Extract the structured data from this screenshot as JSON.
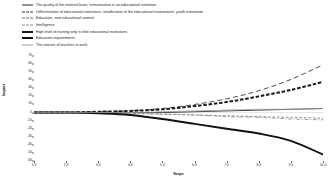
{
  "chart_data": {
    "type": "line",
    "title": "",
    "xlabel": "Steps",
    "ylabel": "Impact",
    "xlim": [
      1.0,
      10.0
    ],
    "ylim": [
      -60,
      70
    ],
    "grid": false,
    "legend_position": "above-plot",
    "xticks": [
      "1.0",
      "2.0",
      "3.0",
      "4.0",
      "5.0",
      "6.0",
      "7.0",
      "8.0",
      "9.0",
      "10.0"
    ],
    "yticks": [
      "70",
      "60",
      "50",
      "40",
      "30",
      "20",
      "10",
      "0",
      "-10",
      "-20",
      "-30",
      "-40",
      "-50",
      "-60"
    ],
    "x": [
      1.0,
      2.0,
      3.0,
      4.0,
      5.0,
      6.0,
      7.0,
      8.0,
      9.0,
      10.0
    ],
    "series": [
      {
        "name": "The quality of the material base, remuneration in an educational institution",
        "style": "solid-thin",
        "color": "#2b2b2b",
        "values": [
          0,
          0,
          0,
          0,
          0,
          1,
          2,
          3,
          4,
          5
        ]
      },
      {
        "name": "Differentiation of educational institutions, stratification of the educational environment, youth extremism",
        "style": "dash-long",
        "color": "#3a3a3a",
        "values": [
          0,
          0,
          1,
          2,
          5,
          10,
          17,
          27,
          41,
          59
        ]
      },
      {
        "name": "Education, new educational content",
        "style": "dash-short",
        "color": "#6e6e6e",
        "values": [
          0,
          0,
          0,
          -1,
          -2,
          -3,
          -4,
          -5,
          -6,
          -7
        ]
      },
      {
        "name": "Intelligence",
        "style": "dashdot",
        "color": "#8a8a8a",
        "values": [
          0,
          0,
          0,
          -1,
          -2,
          -3,
          -5,
          -6,
          -8,
          -9
        ]
      },
      {
        "name": "High level of training only in elite educational institutions",
        "style": "dash-bold",
        "color": "#1a1a1a",
        "values": [
          0,
          0,
          1,
          2,
          4,
          8,
          13,
          20,
          28,
          38
        ]
      },
      {
        "name": "Education requirements",
        "style": "solid-bold",
        "color": "#111111",
        "values": [
          0,
          0,
          -1,
          -3,
          -8,
          -14,
          -20,
          -26,
          -35,
          -52
        ]
      },
      {
        "name": "The interest of teachers in work",
        "style": "solid-gray",
        "color": "#9a9a9a",
        "values": [
          0,
          0,
          0,
          0,
          1,
          2,
          3,
          4,
          4,
          5
        ]
      }
    ]
  }
}
